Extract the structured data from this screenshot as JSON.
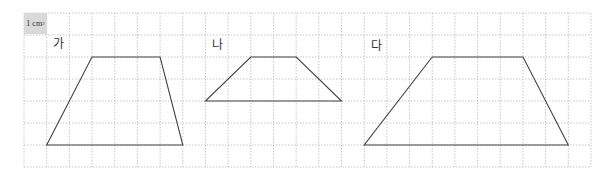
{
  "grid": {
    "origin_x": 24,
    "origin_y": 13,
    "cell_w": 22.68,
    "cell_h": 22,
    "cols": 25,
    "rows": 7,
    "line_color": "#b8b8b8",
    "unit_label": "1 cm",
    "unit_label_sup": "2",
    "unit_box_color": "#d9d9d9"
  },
  "shapes": [
    {
      "label": "가",
      "type": "trapezoid",
      "label_pos": [
        53,
        38
      ],
      "vertices_cells": [
        [
          3,
          2
        ],
        [
          6,
          2
        ],
        [
          7,
          6
        ],
        [
          1,
          6
        ]
      ],
      "top_base_cells": 3,
      "bottom_base_cells": 6,
      "height_cells": 4
    },
    {
      "label": "나",
      "type": "trapezoid",
      "label_pos": [
        212,
        39
      ],
      "vertices_cells": [
        [
          10,
          2
        ],
        [
          12,
          2
        ],
        [
          14,
          4
        ],
        [
          8,
          4
        ]
      ],
      "top_base_cells": 2,
      "bottom_base_cells": 6,
      "height_cells": 2
    },
    {
      "label": "다",
      "type": "trapezoid",
      "label_pos": [
        371,
        40
      ],
      "vertices_cells": [
        [
          18,
          2
        ],
        [
          22,
          2
        ],
        [
          24,
          6
        ],
        [
          15,
          6
        ]
      ],
      "top_base_cells": 4,
      "bottom_base_cells": 9,
      "height_cells": 4
    }
  ],
  "colors": {
    "shape_stroke": "#444444",
    "label_text": "#333333"
  }
}
